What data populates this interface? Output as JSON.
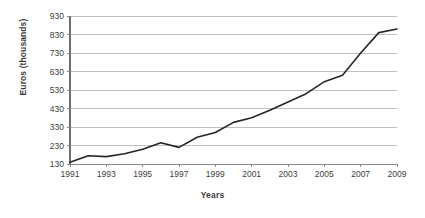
{
  "chart_data": {
    "type": "line",
    "title": "",
    "xlabel": "Years",
    "ylabel": "Euros (thousands)",
    "x": [
      1991,
      1992,
      1993,
      1994,
      1995,
      1996,
      1997,
      1998,
      1999,
      2000,
      2001,
      2002,
      2003,
      2004,
      2005,
      2006,
      2007,
      2008,
      2009
    ],
    "values": [
      140,
      175,
      170,
      185,
      210,
      245,
      220,
      275,
      300,
      355,
      380,
      420,
      465,
      510,
      575,
      610,
      730,
      840,
      860
    ],
    "series": [
      {
        "name": "Euros (thousands)",
        "values": [
          140,
          175,
          170,
          185,
          210,
          245,
          220,
          275,
          300,
          355,
          380,
          420,
          465,
          510,
          575,
          610,
          730,
          840,
          860
        ]
      }
    ],
    "xlim": [
      1991,
      2009
    ],
    "ylim": [
      130,
      930
    ],
    "y_ticks": [
      130,
      230,
      330,
      430,
      530,
      630,
      730,
      830,
      930
    ],
    "y_tick_labels": [
      "130",
      "230",
      "330",
      "430",
      "530",
      "630",
      "730",
      "830",
      "930"
    ],
    "x_ticks": [
      1991,
      1993,
      1995,
      1997,
      1999,
      2001,
      2003,
      2005,
      2007,
      2009
    ],
    "x_tick_labels": [
      "1991",
      "1993",
      "1995",
      "1997",
      "1999",
      "2001",
      "2003",
      "2005",
      "2007",
      "2009"
    ],
    "grid": true,
    "grid_axis": "y",
    "legend": false,
    "legend_position": "none",
    "line_color": "#262626",
    "grid_color": "#bfbfbf",
    "axis_color": "#808080",
    "text_color": "#404040",
    "background_color": "#ffffff"
  },
  "layout": {
    "plot_left": 70,
    "plot_right": 397,
    "plot_top": 16,
    "plot_bottom": 164
  }
}
